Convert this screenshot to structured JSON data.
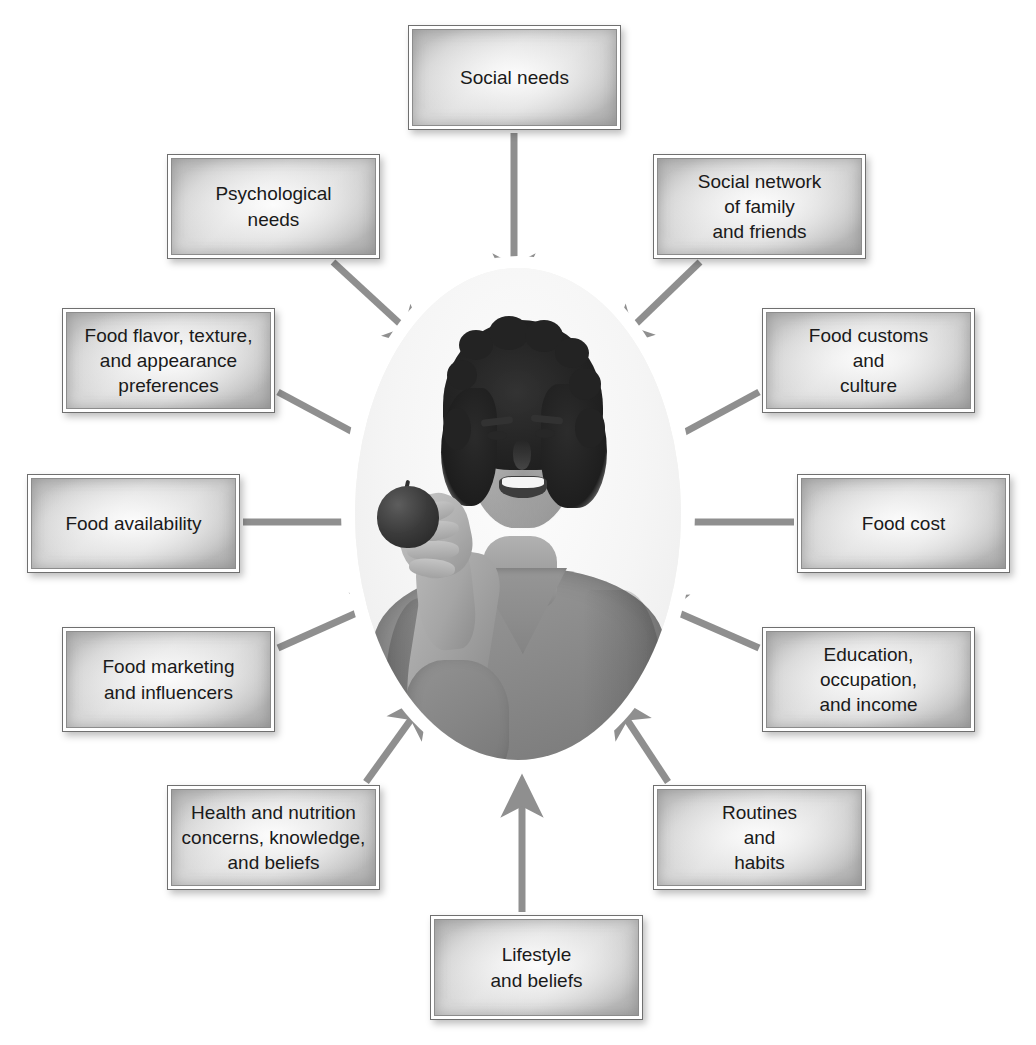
{
  "caption": {
    "top_fragment": ""
  },
  "diagram": {
    "center": {
      "name": "center-photo",
      "description": "Smiling young man holding an apple",
      "alt": "Grayscale photo of a smiling young man with curly dark hair wearing a gray v-neck t-shirt, holding an apple"
    },
    "arrow_color": "#8f8f8f",
    "box_border_color": "#6f6f6f",
    "text_color": "#1a1a1a",
    "nodes": [
      {
        "id": "social-needs",
        "label": "Social needs",
        "position": "top",
        "x": 408,
        "y": 25,
        "w": 213,
        "h": 105
      },
      {
        "id": "psychological-needs",
        "label": "Psychological\nneeds",
        "position": "top-left",
        "x": 167,
        "y": 154,
        "w": 213,
        "h": 105
      },
      {
        "id": "social-network",
        "label": "Social network\nof family\nand friends",
        "position": "top-right",
        "x": 653,
        "y": 154,
        "w": 213,
        "h": 105
      },
      {
        "id": "food-flavor-texture-appearance",
        "label": "Food flavor, texture,\nand appearance\npreferences",
        "position": "upper-left",
        "x": 62,
        "y": 308,
        "w": 213,
        "h": 105
      },
      {
        "id": "food-customs-culture",
        "label": "Food customs\nand\nculture",
        "position": "upper-right",
        "x": 762,
        "y": 308,
        "w": 213,
        "h": 105
      },
      {
        "id": "food-availability",
        "label": "Food availability",
        "position": "left",
        "x": 27,
        "y": 474,
        "w": 213,
        "h": 99
      },
      {
        "id": "food-cost",
        "label": "Food cost",
        "position": "right",
        "x": 797,
        "y": 474,
        "w": 213,
        "h": 99
      },
      {
        "id": "food-marketing-influencers",
        "label": "Food marketing\nand influencers",
        "position": "lower-left",
        "x": 62,
        "y": 627,
        "w": 213,
        "h": 105
      },
      {
        "id": "education-occupation-income",
        "label": "Education,\noccupation,\nand income",
        "position": "lower-right",
        "x": 762,
        "y": 627,
        "w": 213,
        "h": 105
      },
      {
        "id": "health-nutrition-concerns",
        "label": "Health and nutrition\nconcerns, knowledge,\nand beliefs",
        "position": "bottom-left",
        "x": 167,
        "y": 785,
        "w": 213,
        "h": 105
      },
      {
        "id": "routines-habits",
        "label": "Routines\nand\nhabits",
        "position": "bottom-right",
        "x": 653,
        "y": 785,
        "w": 213,
        "h": 105
      },
      {
        "id": "lifestyle-beliefs",
        "label": "Lifestyle\nand beliefs",
        "position": "bottom",
        "x": 430,
        "y": 915,
        "w": 213,
        "h": 105
      }
    ],
    "arrows": [
      {
        "from": "social-needs",
        "x1": 514,
        "y1": 133,
        "x2": 514,
        "y2": 289
      },
      {
        "from": "psychological-needs",
        "x1": 333,
        "y1": 262,
        "x2": 422,
        "y2": 344
      },
      {
        "from": "social-network",
        "x1": 700,
        "y1": 262,
        "x2": 615,
        "y2": 344
      },
      {
        "from": "food-flavor-texture-appearance",
        "x1": 278,
        "y1": 392,
        "x2": 390,
        "y2": 452
      },
      {
        "from": "food-customs-culture",
        "x1": 759,
        "y1": 392,
        "x2": 648,
        "y2": 452
      },
      {
        "from": "food-availability",
        "x1": 243,
        "y1": 522,
        "x2": 385,
        "y2": 522
      },
      {
        "from": "food-cost",
        "x1": 794,
        "y1": 522,
        "x2": 652,
        "y2": 522
      },
      {
        "from": "food-marketing-influencers",
        "x1": 278,
        "y1": 648,
        "x2": 390,
        "y2": 598
      },
      {
        "from": "education-occupation-income",
        "x1": 759,
        "y1": 648,
        "x2": 649,
        "y2": 600
      },
      {
        "from": "health-nutrition-concerns",
        "x1": 366,
        "y1": 782,
        "x2": 425,
        "y2": 700
      },
      {
        "from": "routines-habits",
        "x1": 668,
        "y1": 782,
        "x2": 614,
        "y2": 700
      },
      {
        "from": "lifestyle-beliefs",
        "x1": 522,
        "y1": 912,
        "x2": 522,
        "y2": 782
      }
    ]
  }
}
